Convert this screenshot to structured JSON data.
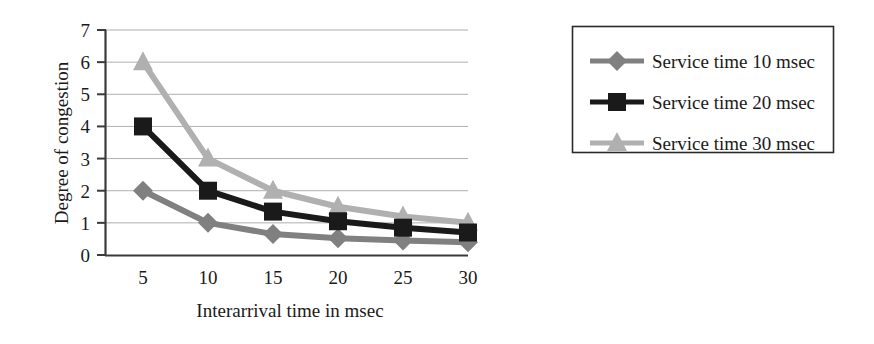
{
  "chart_data": {
    "type": "line",
    "title": "",
    "xlabel": "Interarrival time in msec",
    "ylabel": "Degree of congestion",
    "categories": [
      "5",
      "10",
      "15",
      "20",
      "25",
      "30"
    ],
    "x": [
      5,
      10,
      15,
      20,
      25,
      30
    ],
    "xlim": [
      5,
      30
    ],
    "ylim": [
      0,
      7
    ],
    "yticks": [
      "0",
      "1",
      "2",
      "3",
      "4",
      "5",
      "6",
      "7"
    ],
    "ytick_values": [
      0,
      1,
      2,
      3,
      4,
      5,
      6,
      7
    ],
    "grid": "horizontal",
    "legend_position": "right-outside",
    "series": [
      {
        "name": "Service time 10 msec",
        "marker": "diamond",
        "color": "#808080",
        "values": [
          2.0,
          1.0,
          0.65,
          0.52,
          0.45,
          0.4
        ]
      },
      {
        "name": "Service time 20 msec",
        "marker": "square",
        "color": "#1a1a1a",
        "values": [
          4.0,
          2.0,
          1.35,
          1.05,
          0.85,
          0.7
        ]
      },
      {
        "name": "Service time 30 msec",
        "marker": "triangle",
        "color": "#b0b0b0",
        "values": [
          6.0,
          3.0,
          2.0,
          1.5,
          1.2,
          1.0
        ]
      }
    ]
  },
  "axes": {
    "x_title": "Interarrival time in msec",
    "y_title": "Degree of congestion",
    "x_tick_labels": [
      "5",
      "10",
      "15",
      "20",
      "25",
      "30"
    ],
    "y_tick_labels": [
      "0",
      "1",
      "2",
      "3",
      "4",
      "5",
      "6",
      "7"
    ]
  },
  "legend": {
    "entries": [
      {
        "label": "Service time 10 msec",
        "marker": "diamond",
        "color": "#808080"
      },
      {
        "label": "Service time 20 msec",
        "marker": "square",
        "color": "#1a1a1a"
      },
      {
        "label": "Service time 30 msec",
        "marker": "triangle",
        "color": "#b0b0b0"
      }
    ]
  },
  "colors": {
    "series_10": "#808080",
    "series_20": "#1a1a1a",
    "series_30": "#b0b0b0",
    "gridline": "#9a9a9a",
    "axis": "#3a3a3a",
    "background": "#ffffff"
  }
}
